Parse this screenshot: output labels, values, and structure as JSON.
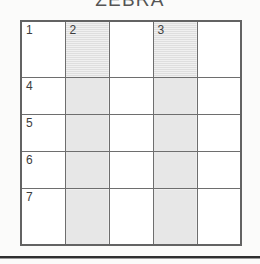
{
  "document": {
    "title": "ZEBRA",
    "background_color": "#fbfbfa",
    "rule_color": "#2f2f2f"
  },
  "grid": {
    "rows": 5,
    "columns": 5,
    "shaded_columns": [
      2,
      4
    ],
    "shaded_color": "#d4d4d4",
    "cell_color": "#ffffff",
    "border_color": "#6e6e6e",
    "cells": [
      [
        {
          "number": "1",
          "shaded": false
        },
        {
          "number": "2",
          "shaded": true
        },
        {
          "number": "",
          "shaded": false
        },
        {
          "number": "3",
          "shaded": true
        },
        {
          "number": "",
          "shaded": false
        }
      ],
      [
        {
          "number": "4",
          "shaded": false
        },
        {
          "number": "",
          "shaded": true
        },
        {
          "number": "",
          "shaded": false
        },
        {
          "number": "",
          "shaded": true
        },
        {
          "number": "",
          "shaded": false
        }
      ],
      [
        {
          "number": "5",
          "shaded": false
        },
        {
          "number": "",
          "shaded": true
        },
        {
          "number": "",
          "shaded": false
        },
        {
          "number": "",
          "shaded": true
        },
        {
          "number": "",
          "shaded": false
        }
      ],
      [
        {
          "number": "6",
          "shaded": false
        },
        {
          "number": "",
          "shaded": true
        },
        {
          "number": "",
          "shaded": false
        },
        {
          "number": "",
          "shaded": true
        },
        {
          "number": "",
          "shaded": false
        }
      ],
      [
        {
          "number": "7",
          "shaded": false
        },
        {
          "number": "",
          "shaded": true
        },
        {
          "number": "",
          "shaded": false
        },
        {
          "number": "",
          "shaded": true
        },
        {
          "number": "",
          "shaded": false
        }
      ]
    ]
  }
}
